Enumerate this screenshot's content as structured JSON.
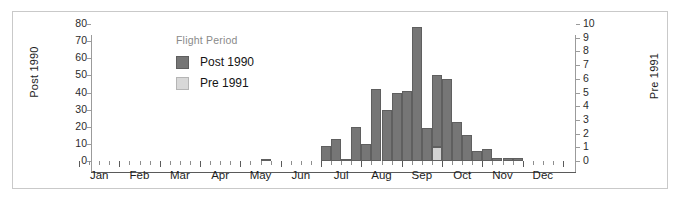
{
  "chart_data": {
    "type": "bar",
    "title": "",
    "subtitle": "",
    "xlabel": "",
    "ylabel": "Post 1990",
    "ylabel_right": "Pre 1991",
    "grid": false,
    "legend_position": "top-left-inside",
    "legend_title": "Flight Period",
    "ylim": [
      0,
      80
    ],
    "yticks": [
      0,
      10,
      20,
      30,
      40,
      50,
      60,
      70,
      80
    ],
    "ylim_right": [
      0,
      10
    ],
    "yticks_right": [
      0,
      1,
      2,
      3,
      4,
      5,
      6,
      7,
      8,
      9,
      10
    ],
    "month_labels": [
      "Jan",
      "Feb",
      "Mar",
      "Apr",
      "May",
      "Jun",
      "Jul",
      "Aug",
      "Sep",
      "Oct",
      "Nov",
      "Dec"
    ],
    "bins_per_month": 4,
    "x_note": "Weekly bins across the calendar year; month labels centred on each month.",
    "series": [
      {
        "name": "Post 1990",
        "color": "#767676",
        "axis": "left",
        "values": [
          0,
          0,
          0,
          0,
          0,
          0,
          0,
          0,
          0,
          0,
          0,
          0,
          0,
          0,
          0,
          0,
          0,
          0,
          1,
          0,
          0,
          0,
          0,
          0,
          9,
          13,
          1,
          20,
          10,
          42,
          30,
          40,
          41,
          78,
          19,
          50,
          48,
          23,
          15,
          6,
          7,
          2,
          2,
          2,
          0,
          0,
          0,
          0
        ]
      },
      {
        "name": "Pre 1991",
        "color": "#d2d2d2",
        "axis": "right",
        "values": [
          0,
          0,
          0,
          0,
          0,
          0,
          0,
          0,
          0,
          0,
          0,
          0,
          0,
          0,
          0,
          0,
          0,
          0,
          0,
          0,
          0,
          0,
          0,
          0,
          0,
          0,
          0,
          0,
          0,
          0,
          0,
          0,
          0,
          0,
          0,
          1,
          0,
          0,
          0,
          0,
          0,
          0,
          0,
          0,
          0,
          0,
          0,
          0
        ]
      }
    ],
    "legend_entries": [
      {
        "label": "Post 1990",
        "color": "#767676"
      },
      {
        "label": "Pre 1991",
        "color": "#d8d8d8"
      }
    ]
  },
  "figure": {
    "border_color": "#c9c9c9",
    "background": "#ffffff",
    "axis_color": "#5a5a5a"
  }
}
